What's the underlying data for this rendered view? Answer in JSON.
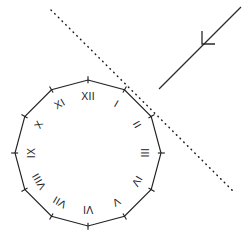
{
  "figure": {
    "title": "Dodecagon clock face with crossing dotted line and arrowed solid ray",
    "background_color": "#ffffff",
    "ink_color": "#222222",
    "width": 251,
    "height": 242
  },
  "clock": {
    "name": "dodecagon-clock-face",
    "shape": "dodecagon",
    "sides": 12,
    "center": {
      "x": 88,
      "y": 153
    },
    "radius": 73,
    "stroke_color": "#222222",
    "tick_length": 7,
    "numeral_radius": 56,
    "numeral_font_size": 10.5,
    "numerals": [
      {
        "label": "XII",
        "hour": 12,
        "angle_deg": 0,
        "rotation_deg": 0
      },
      {
        "label": "I",
        "hour": 1,
        "angle_deg": 30,
        "rotation_deg": 30
      },
      {
        "label": "II",
        "hour": 2,
        "angle_deg": 60,
        "rotation_deg": 60
      },
      {
        "label": "III",
        "hour": 3,
        "angle_deg": 90,
        "rotation_deg": 90
      },
      {
        "label": "IV",
        "hour": 4,
        "angle_deg": 120,
        "rotation_deg": 120
      },
      {
        "label": "V",
        "hour": 5,
        "angle_deg": 150,
        "rotation_deg": 150
      },
      {
        "label": "VI",
        "hour": 6,
        "angle_deg": 180,
        "rotation_deg": 180
      },
      {
        "label": "VII",
        "hour": 7,
        "angle_deg": 210,
        "rotation_deg": 210
      },
      {
        "label": "VIII",
        "hour": 8,
        "angle_deg": 240,
        "rotation_deg": 240
      },
      {
        "label": "IX",
        "hour": 9,
        "angle_deg": 270,
        "rotation_deg": 270
      },
      {
        "label": "X",
        "hour": 10,
        "angle_deg": 300,
        "rotation_deg": 300
      },
      {
        "label": "XI",
        "hour": 11,
        "angle_deg": 330,
        "rotation_deg": 330
      }
    ]
  },
  "dotted_line": {
    "name": "dotted-line",
    "style": "dotted",
    "color": "#1b1b1b",
    "x1": 51,
    "y1": 10,
    "x2": 234,
    "y2": 192
  },
  "solid_arrow": {
    "name": "solid-arrow-ray",
    "style": "solid",
    "color": "#2a2a2a",
    "x1": 241,
    "y1": 7,
    "x2": 159,
    "y2": 89,
    "arrow_tip": {
      "x": 202,
      "y": 44
    },
    "arrow_direction": "down-left"
  }
}
